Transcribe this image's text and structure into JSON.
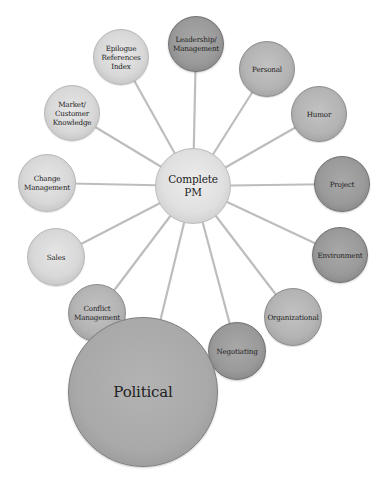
{
  "diagram": {
    "center": {
      "label": "Complete PM",
      "line1": "Complete",
      "line2": "PM",
      "x": 193,
      "y": 186,
      "r": 38
    },
    "spoke_color": "#bdbdbd",
    "nodes": [
      {
        "id": "epilogue",
        "lines": [
          "Epilogue",
          "References",
          "Index"
        ],
        "x": 121,
        "y": 57,
        "r": 28,
        "tone": "light"
      },
      {
        "id": "leadership",
        "lines": [
          "Leadership/",
          "Management"
        ],
        "x": 196,
        "y": 44,
        "r": 28,
        "tone": "dark"
      },
      {
        "id": "personal",
        "lines": [
          "Personal"
        ],
        "x": 267,
        "y": 69,
        "r": 28,
        "tone": "mid"
      },
      {
        "id": "humor",
        "lines": [
          "Humor"
        ],
        "x": 319,
        "y": 114,
        "r": 28,
        "tone": "mid"
      },
      {
        "id": "project",
        "lines": [
          "Project"
        ],
        "x": 342,
        "y": 184,
        "r": 28,
        "tone": "dark"
      },
      {
        "id": "environment",
        "lines": [
          "Environment"
        ],
        "x": 340,
        "y": 255,
        "r": 28,
        "tone": "dark"
      },
      {
        "id": "organizational",
        "lines": [
          "Organizational"
        ],
        "x": 293,
        "y": 317,
        "r": 29,
        "tone": "mid"
      },
      {
        "id": "negotiating",
        "lines": [
          "Negotiating"
        ],
        "x": 237,
        "y": 351,
        "r": 29,
        "tone": "dark"
      },
      {
        "id": "political",
        "lines": [
          "Political"
        ],
        "x": 143,
        "y": 392,
        "r": 75,
        "tone": "political"
      },
      {
        "id": "conflict",
        "lines": [
          "Conflict",
          "Management"
        ],
        "x": 97,
        "y": 313,
        "r": 29,
        "tone": "mid"
      },
      {
        "id": "sales",
        "lines": [
          "Sales"
        ],
        "x": 56,
        "y": 257,
        "r": 29,
        "tone": "light"
      },
      {
        "id": "change",
        "lines": [
          "Change",
          "Management"
        ],
        "x": 47,
        "y": 183,
        "r": 29,
        "tone": "light"
      },
      {
        "id": "market",
        "lines": [
          "Market/",
          "Customer",
          "Knowledge"
        ],
        "x": 72,
        "y": 113,
        "r": 28,
        "tone": "light"
      }
    ]
  }
}
